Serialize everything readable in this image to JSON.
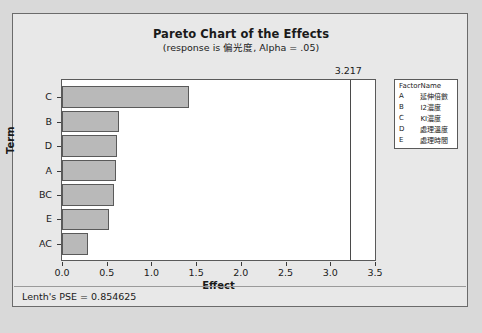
{
  "chart_data": {
    "type": "bar",
    "orientation": "horizontal",
    "title": "Pareto Chart of the Effects",
    "subtitle": "(response is 偏光度, Alpha = .05)",
    "xlabel": "Effect",
    "ylabel": "Term",
    "xlim": [
      0,
      3.5
    ],
    "xticks": [
      "0.0",
      "0.5",
      "1.0",
      "1.5",
      "2.0",
      "2.5",
      "3.0",
      "3.5"
    ],
    "xtick_values": [
      0.0,
      0.5,
      1.0,
      1.5,
      2.0,
      2.5,
      3.0,
      3.5
    ],
    "grid": false,
    "categories": [
      "C",
      "B",
      "D",
      "A",
      "BC",
      "E",
      "AC"
    ],
    "values": [
      1.42,
      0.64,
      0.61,
      0.6,
      0.58,
      0.53,
      0.29
    ],
    "reference_line": {
      "value": 3.217,
      "label": "3.217"
    },
    "annotations": [
      "Lenth's PSE = 0.854625"
    ],
    "legend": {
      "position": "right",
      "headers": [
        "Factor",
        "Name"
      ],
      "rows": [
        {
          "factor": "A",
          "name": "延伸倍數"
        },
        {
          "factor": "B",
          "name": "I2濃度"
        },
        {
          "factor": "C",
          "name": "KI濃度"
        },
        {
          "factor": "D",
          "name": "處理溫度"
        },
        {
          "factor": "E",
          "name": "處理時間"
        }
      ]
    },
    "colors": {
      "bar_fill": "#b9b9b9",
      "bar_edge": "#5a5a5a",
      "plot_background": "#ffffff",
      "window_background": "#e8e8e8",
      "reference_line": "#4a4a4a"
    }
  },
  "footer": {
    "note": "Lenth's PSE = 0.854625"
  }
}
